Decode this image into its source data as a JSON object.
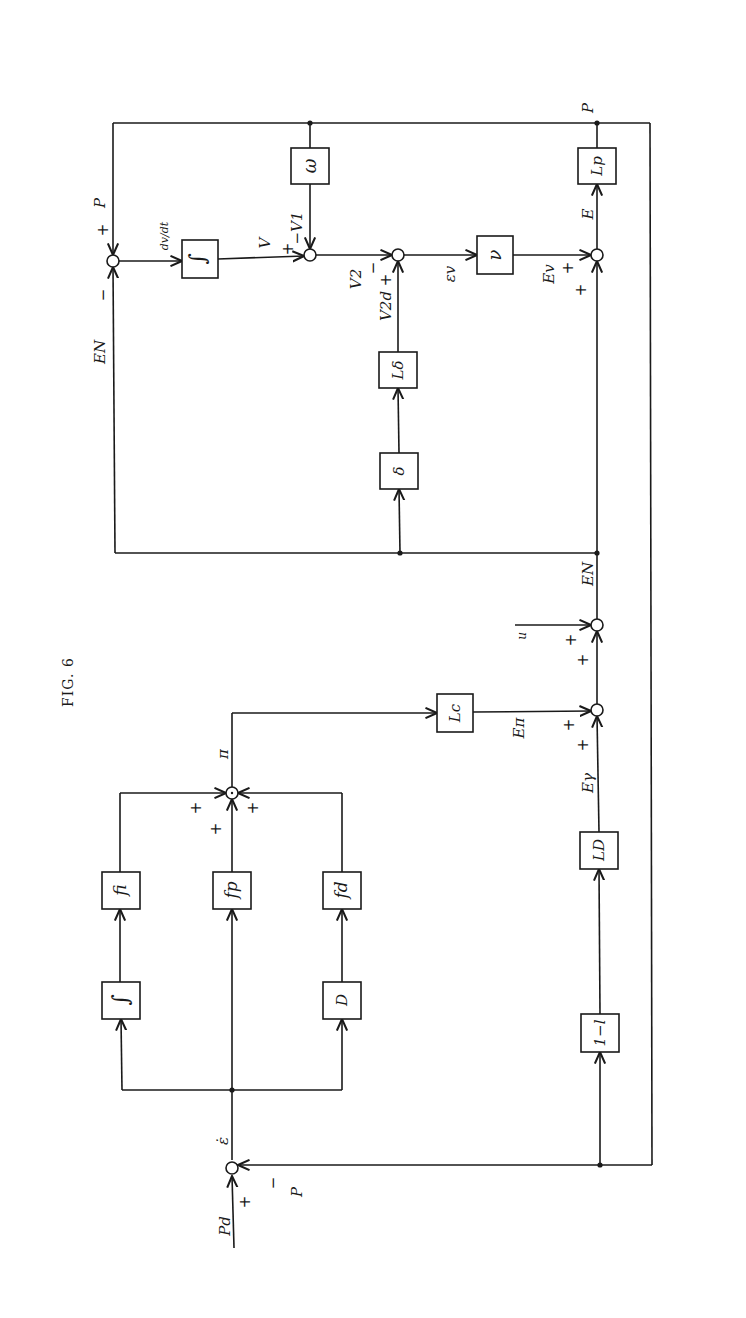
{
  "figure": {
    "title": "FIG. 6",
    "orientation": "rotated 90 degrees counter-clockwise"
  },
  "blocks": {
    "integrator_top": "∫",
    "omega": "ω",
    "nu": "ν",
    "Lp": "Lp",
    "delta": "δ",
    "L_delta": "Lδ",
    "Lc": "Lc",
    "fi": "fi",
    "fp": "fp",
    "fd": "fd",
    "integrator_pid": "∫",
    "D": "D",
    "LD": "LD",
    "one_minus_l": "1−l"
  },
  "signals": {
    "P_top": "P",
    "EN_left": "EN",
    "dv_dt": "dv/dt",
    "V": "V",
    "V1": "−V1",
    "V2": "V2",
    "V2d": "V2d",
    "eps_v": "εv",
    "Ev": "Ev",
    "E": "E",
    "P_out": "P",
    "EN_mid": "EN",
    "u": "u",
    "E_pi": "Eπ",
    "E_gamma": "Eγ",
    "pi": "π",
    "eps": "ε̇",
    "Pd": "Pd",
    "P_fb": "P"
  },
  "signs": {
    "plus": "+",
    "minus": "−"
  }
}
